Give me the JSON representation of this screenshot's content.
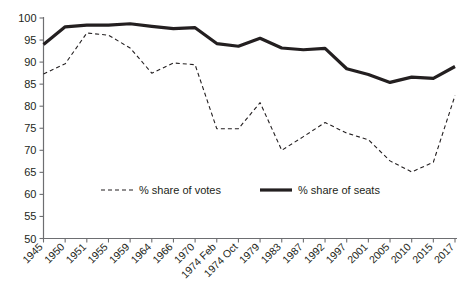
{
  "chart_data": {
    "type": "line",
    "title": "",
    "subtitle": "",
    "xlabel": "",
    "ylabel": "",
    "ylim": [
      50,
      100
    ],
    "ytick_step": 5,
    "yticks": [
      50,
      55,
      60,
      65,
      70,
      75,
      80,
      85,
      90,
      95,
      100
    ],
    "grid": false,
    "legend_position": "inside-lower-center",
    "categories": [
      "1945",
      "1950",
      "1951",
      "1955",
      "1959",
      "1964",
      "1966",
      "1970",
      "1974 Feb",
      "1974 Oct",
      "1979",
      "1983",
      "1987",
      "1992",
      "1997",
      "2001",
      "2005",
      "2010",
      "2015",
      "2017"
    ],
    "series": [
      {
        "name": "% share of votes",
        "style": "dashed",
        "color": "#231f20",
        "values": [
          87.3,
          89.6,
          96.6,
          96.1,
          93.2,
          87.5,
          89.8,
          89.4,
          74.9,
          74.9,
          80.8,
          70.0,
          73.1,
          76.3,
          73.9,
          72.4,
          67.6,
          65.1,
          67.3,
          82.4
        ]
      },
      {
        "name": "% share of seats",
        "style": "solid",
        "color": "#231f20",
        "values": [
          94.0,
          98.0,
          98.4,
          98.4,
          98.7,
          98.1,
          97.6,
          97.8,
          94.2,
          93.6,
          95.4,
          93.2,
          92.8,
          93.1,
          88.5,
          87.2,
          85.4,
          86.6,
          86.3,
          89.0
        ]
      }
    ],
    "legend": [
      {
        "label": "% share of votes",
        "style": "dashed"
      },
      {
        "label": "% share of seats",
        "style": "solid"
      }
    ]
  },
  "colors": {
    "axis": "#6d6e71",
    "ink": "#231f20",
    "background": "#ffffff"
  }
}
